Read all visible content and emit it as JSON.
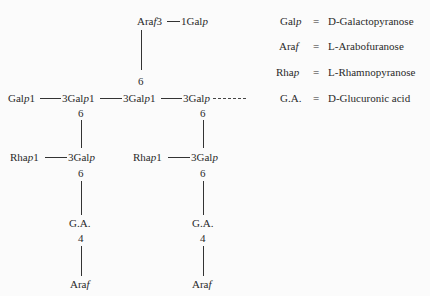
{
  "diagram": {
    "top_branch": {
      "left": "Araf3",
      "right": "1Galp",
      "attach_position": "6"
    },
    "main_chain": [
      {
        "label": "Galp1"
      },
      {
        "label": "3Galp1",
        "branch_position": "6"
      },
      {
        "label": "3Galp1"
      },
      {
        "label": "3Galp",
        "branch_position": "6",
        "continuation": "- - - -"
      }
    ],
    "side_chains": [
      {
        "rha": "Rhap1",
        "gal": "3Galp",
        "gal_position": "6",
        "ga": "G.A.",
        "ga_position": "4",
        "terminal": "Araf"
      },
      {
        "rha": "Rhap1",
        "gal": "3Galp",
        "gal_position": "6",
        "ga": "G.A.",
        "ga_position": "4",
        "terminal": "Araf"
      }
    ]
  },
  "legend": [
    {
      "abbr": "Galp",
      "eq": "=",
      "prefix": "D",
      "name": "-Galactopyranose"
    },
    {
      "abbr": "Araf",
      "eq": "=",
      "prefix": "L",
      "name": "-Arabofuranose"
    },
    {
      "abbr": "Rhap",
      "eq": "=",
      "prefix": "L",
      "name": "-Rhamnopyranose"
    },
    {
      "abbr": "G.A.",
      "eq": "=",
      "prefix": "D",
      "name": "-Glucuronic acid"
    }
  ]
}
